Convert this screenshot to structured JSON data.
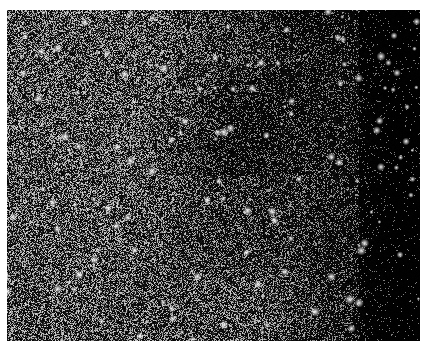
{
  "image": {
    "subject": "black-and-white astronomical photograph of a dense star field",
    "alt": "Grayscale star field photograph with dense stars, brighter on the left and darker on the right",
    "colors": {
      "border": "#ffffff",
      "background_dark": "#050505",
      "background_mid": "#3a3a3a",
      "stars": "#f0f0f0"
    }
  }
}
